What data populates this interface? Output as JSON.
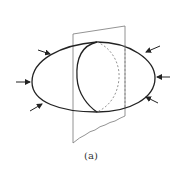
{
  "figure": {
    "caption": "(a)",
    "colors": {
      "outline": "#222222",
      "plane": "#777777",
      "hidden": "#888888"
    },
    "arrows": [
      {
        "name": "upper-left",
        "direction": "inward"
      },
      {
        "name": "left",
        "direction": "inward"
      },
      {
        "name": "lower-left",
        "direction": "inward"
      },
      {
        "name": "upper-right",
        "direction": "inward"
      },
      {
        "name": "right",
        "direction": "inward"
      },
      {
        "name": "lower-right",
        "direction": "inward"
      }
    ]
  }
}
